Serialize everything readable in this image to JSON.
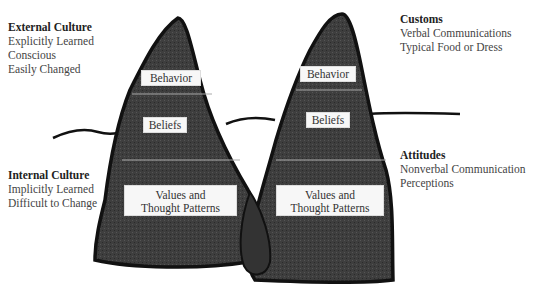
{
  "annotations": {
    "external_culture": {
      "title": "External Culture",
      "lines": [
        "Explicitly Learned",
        "Conscious",
        "Easily Changed"
      ]
    },
    "internal_culture": {
      "title": "Internal Culture",
      "lines": [
        "Implicitly Learned",
        "Difficult to Change"
      ]
    },
    "customs": {
      "title": "Customs",
      "lines": [
        "Verbal Communications",
        "Typical Food or Dress"
      ]
    },
    "attitudes": {
      "title": "Attitudes",
      "lines": [
        "Nonverbal Communication",
        "Perceptions"
      ]
    }
  },
  "left_iceberg": {
    "layers": [
      "Behavior",
      "Beliefs",
      "Values and",
      "Thought Patterns"
    ]
  },
  "right_iceberg": {
    "layers": [
      "Behavior",
      "Beliefs",
      "Values and",
      "Thought Patterns"
    ]
  },
  "colors": {
    "fill": "#3e3e3e",
    "outline": "#111111",
    "box": "#f7f7f7"
  }
}
